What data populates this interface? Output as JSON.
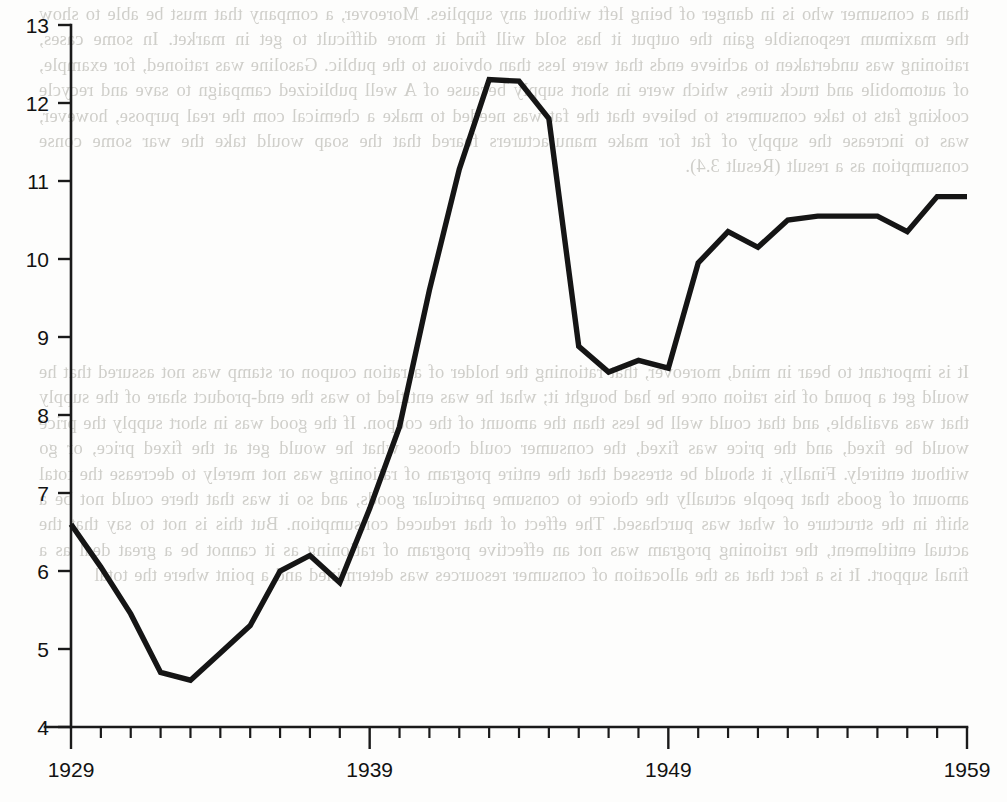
{
  "page": {
    "kind": "scanned-book-page-with-figure",
    "width": 1007,
    "height": 802,
    "background_color": "#fdfdfc",
    "ink_color": "#151515"
  },
  "bleed_through_text": {
    "note": "faint mirrored text showing through from the reverse side of the scanned page",
    "color": "#9a9890",
    "block_1": "than a consumer who is in danger of being left without any supplies. Moreover, a company that must be able to show the maximum responsible gain the output it has sold will find it more difficult to get in market. In some cases, rationing was undertaken to achieve ends that were less than obvious to the public. Gasoline was rationed, for example, of automobile and truck tires, which were in short supply because of A well publicized campaign to save and recycle cooking fats to take consumers to believe that the fat was needed to make a chemical com the real purpose, however, was to increase the supply of fat for make manufacturers feared that the soap would take the war some conse consumption as a result (Result 3.4).",
    "block_2": "It is important to bear in mind, moreover, that rationing the holder of a ration coupon or stamp was not assured that he would get a pound of his ration once he had bought it; what he was entitled to was the end-product share of the supply that was available, and that could well be less than the amount of the coupon. If the good was in short supply the price would be fixed, and the price was fixed, the consumer could choose what he would get at the fixed price, or go without entirely. Finally, it should be stressed that the entire program of rationing was not merely to decrease the total amount of goods that people actually the choice to consume particular goods, and so it was that there could not be a shift in the structure of what was purchased. The effect of that reduced consumption. But this is not to say that the actual entitlement, the rationing program was not an effective program of rationing as it cannot be a great deal as a final support. It is a fact that as the allocation of consumer resources was determined and a point where the total"
  },
  "chart_data": {
    "type": "line",
    "title": "",
    "xlabel": "",
    "ylabel": "",
    "xlim": [
      1929,
      1959
    ],
    "ylim": [
      4,
      13
    ],
    "grid": false,
    "legend": null,
    "y_ticks": [
      4,
      5,
      6,
      7,
      8,
      9,
      10,
      11,
      12,
      13
    ],
    "y_tick_labels": [
      "4",
      "5",
      "6",
      "7",
      "8",
      "9",
      "10",
      "11",
      "12",
      "13"
    ],
    "x_tick_major": [
      1929,
      1939,
      1949,
      1959
    ],
    "x_tick_major_labels": [
      "1929",
      "1939",
      "1949",
      "1959"
    ],
    "x_tick_minor_step": 1,
    "x": [
      1929,
      1930,
      1931,
      1932,
      1933,
      1934,
      1935,
      1936,
      1937,
      1938,
      1939,
      1940,
      1941,
      1942,
      1943,
      1944,
      1945,
      1946,
      1947,
      1948,
      1949,
      1950,
      1951,
      1952,
      1953,
      1954,
      1955,
      1956,
      1957,
      1958,
      1959
    ],
    "series": [
      {
        "name": "series-1",
        "color": "#151515",
        "values": [
          6.6,
          6.05,
          5.45,
          4.7,
          4.6,
          4.95,
          5.3,
          6.0,
          6.2,
          5.85,
          6.8,
          7.85,
          9.6,
          11.15,
          12.3,
          12.28,
          11.8,
          8.88,
          8.55,
          8.7,
          8.6,
          9.95,
          10.35,
          10.15,
          10.5,
          10.55,
          10.55,
          10.55,
          10.35,
          10.8,
          10.8
        ]
      }
    ]
  },
  "axes_geometry": {
    "plot_left_px": 71,
    "plot_right_px": 967,
    "plot_top_px": 25,
    "plot_bottom_px": 727,
    "y_min": 4,
    "y_max": 13,
    "x_min": 1929,
    "x_max": 1959
  }
}
